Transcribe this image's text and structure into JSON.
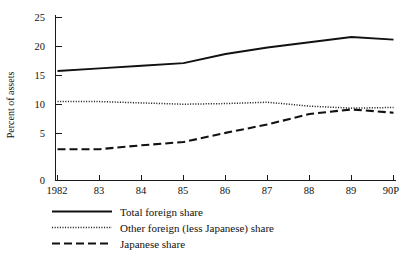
{
  "chart_data": {
    "type": "line",
    "title": "",
    "xlabel": "",
    "ylabel": "Percent of assets",
    "categories": [
      "1982",
      "83",
      "84",
      "85",
      "86",
      "87",
      "88",
      "89",
      "90P"
    ],
    "ylim": [
      0,
      25
    ],
    "yticks": [
      0,
      5,
      10,
      15,
      20,
      25
    ],
    "grid": false,
    "legend_position": "below",
    "series": [
      {
        "name": "Total foreign share",
        "style": "solid",
        "color": "#111111",
        "values": [
          16.8,
          17.2,
          17.6,
          18.0,
          19.4,
          20.4,
          21.2,
          22.0,
          21.6
        ]
      },
      {
        "name": "Other foreign (less Japanese) share",
        "style": "dotted",
        "color": "#222222",
        "values": [
          12.1,
          12.1,
          11.9,
          11.7,
          11.8,
          12.0,
          11.4,
          11.1,
          11.2
        ]
      },
      {
        "name": "Japanese share",
        "style": "dashed",
        "color": "#111111",
        "values": [
          4.8,
          4.8,
          5.4,
          5.9,
          7.3,
          8.6,
          10.2,
          10.9,
          10.4
        ]
      }
    ]
  },
  "axis": {
    "y_title": "Percent of assets",
    "y_tick_labels": [
      "25",
      "20",
      "15",
      "10",
      "5",
      "0"
    ],
    "x_tick_labels": [
      "1982",
      "83",
      "84",
      "85",
      "86",
      "87",
      "88",
      "89",
      "90P"
    ]
  },
  "legend": {
    "items": [
      {
        "label": "Total foreign share",
        "style": "solid"
      },
      {
        "label": "Other foreign (less Japanese) share",
        "style": "dotted"
      },
      {
        "label": "Japanese share",
        "style": "dashed"
      }
    ]
  }
}
